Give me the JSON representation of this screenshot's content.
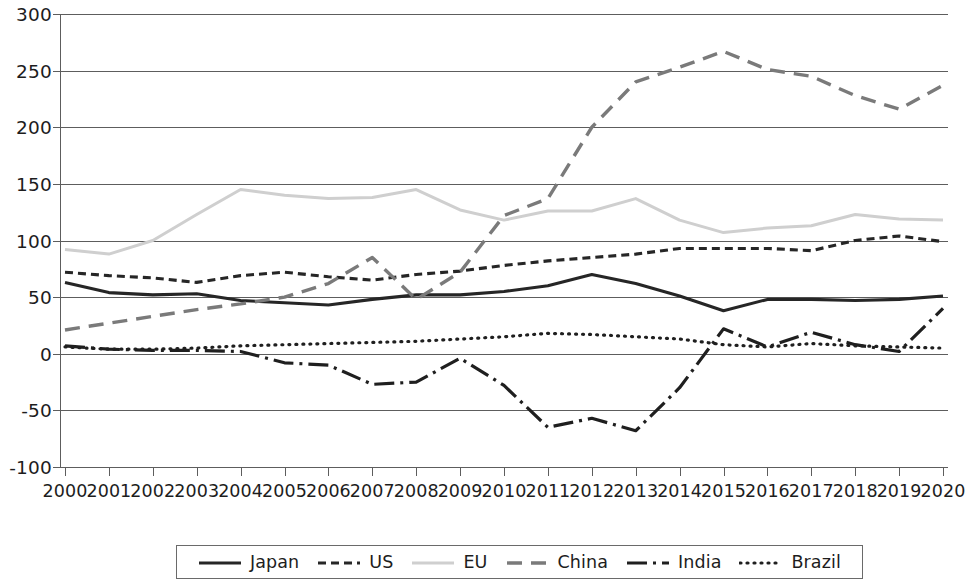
{
  "chart_data": {
    "type": "line",
    "title": "",
    "subtitle": "",
    "xlabel": "",
    "ylabel": "",
    "grid": true,
    "legend_position": "bottom",
    "xlim": [
      2000,
      2020
    ],
    "ylim": [
      -100,
      300
    ],
    "y_ticks": [
      300,
      250,
      200,
      150,
      100,
      50,
      0,
      -50,
      -100
    ],
    "y_tick_labels": [
      "300",
      "250",
      "200",
      "150",
      "100",
      "50",
      "0",
      "-50",
      "-100"
    ],
    "categories": [
      2000,
      2001,
      2002,
      2003,
      2004,
      2005,
      2006,
      2007,
      2008,
      2009,
      2010,
      2011,
      2012,
      2013,
      2014,
      2015,
      2016,
      2017,
      2018,
      2019,
      2020
    ],
    "x_tick_labels": [
      "2000",
      "2001",
      "2002",
      "2003",
      "2004",
      "2005",
      "2006",
      "2007",
      "2008",
      "2009",
      "2010",
      "2011",
      "2012",
      "2013",
      "2014",
      "2015",
      "2016",
      "2017",
      "2018",
      "2019",
      "2020"
    ],
    "series": [
      {
        "name": "Japan",
        "style": "solid",
        "color": "#262626",
        "width": 3.1,
        "dash": "",
        "values": [
          63,
          54,
          52,
          53,
          47,
          45,
          43,
          48,
          52,
          52,
          55,
          60,
          70,
          62,
          51,
          38,
          48,
          48,
          47,
          48,
          51
        ]
      },
      {
        "name": "US",
        "style": "dashed",
        "color": "#262626",
        "width": 3.1,
        "dash": "8,5",
        "values": [
          72,
          69,
          67,
          63,
          69,
          72,
          68,
          65,
          70,
          73,
          78,
          82,
          85,
          88,
          93,
          93,
          93,
          91,
          100,
          104,
          99
        ]
      },
      {
        "name": "EU",
        "style": "solid",
        "color": "#cfcfcf",
        "width": 3.0,
        "dash": "",
        "values": [
          92,
          88,
          100,
          123,
          145,
          140,
          137,
          138,
          145,
          127,
          118,
          126,
          126,
          137,
          118,
          107,
          111,
          113,
          123,
          119,
          118
        ]
      },
      {
        "name": "China",
        "style": "long-dash",
        "color": "#7a7a7a",
        "width": 3.4,
        "dash": "15,9",
        "values": [
          21,
          27,
          33,
          39,
          44,
          50,
          62,
          85,
          48,
          72,
          122,
          137,
          200,
          240,
          253,
          267,
          251,
          245,
          228,
          216,
          237
        ]
      },
      {
        "name": "India",
        "style": "dash-dot",
        "color": "#1f1f1f",
        "width": 3.2,
        "dash": "20,6,3,6",
        "values": [
          7,
          4,
          3,
          3,
          2,
          -8,
          -10,
          -27,
          -25,
          -4,
          -28,
          -65,
          -57,
          -68,
          -30,
          22,
          6,
          19,
          8,
          2,
          40
        ]
      },
      {
        "name": "Brazil",
        "style": "dotted",
        "color": "#1f1f1f",
        "width": 3.2,
        "dash": "1,6",
        "values": [
          6,
          4,
          4,
          5,
          7,
          8,
          9,
          10,
          11,
          13,
          15,
          18,
          17,
          15,
          13,
          8,
          6,
          9,
          7,
          6,
          5
        ]
      }
    ]
  },
  "legend": {
    "items": [
      {
        "label": "Japan"
      },
      {
        "label": "US"
      },
      {
        "label": "EU"
      },
      {
        "label": "China"
      },
      {
        "label": "India"
      },
      {
        "label": "Brazil"
      }
    ]
  }
}
